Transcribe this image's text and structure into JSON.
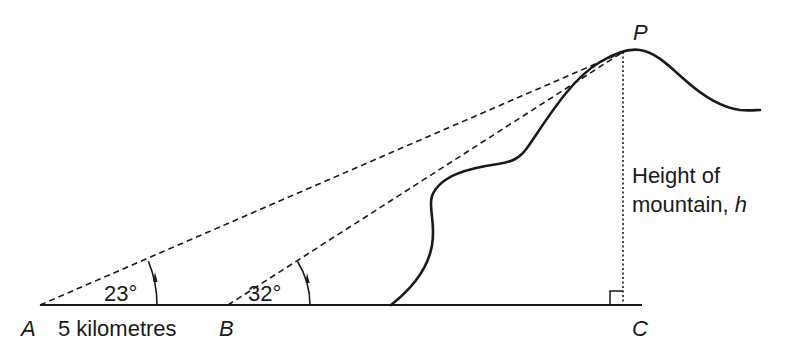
{
  "diagram": {
    "type": "angle-of-elevation",
    "points": {
      "A": {
        "label": "A"
      },
      "B": {
        "label": "B"
      },
      "C": {
        "label": "C"
      },
      "P": {
        "label": "P"
      }
    },
    "distance_label": "5 kilometres",
    "angles": [
      {
        "at": "A",
        "label": "23°"
      },
      {
        "at": "B",
        "label": "32°"
      }
    ],
    "height_label": {
      "line1": "Height of",
      "line2": "mountain, ",
      "variable": "h"
    },
    "colors": {
      "ink": "#1a1a1a",
      "background": "#ffffff"
    }
  }
}
